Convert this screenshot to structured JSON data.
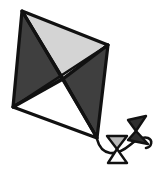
{
  "artwork": {
    "title": "Kite",
    "subject": "diamond kite with trailing tail and two bow ties",
    "caption": "kite",
    "background_color": "#ffffff",
    "outline_color": "#111111"
  },
  "palette": {
    "light_gray": "#d4d4d4",
    "dark_gray": "#3f3f3f",
    "white": "#ffffff",
    "outline": "#111111",
    "mid_gray": "#b8b8b8"
  },
  "kite": {
    "name": "diamond-kite",
    "vertices": {
      "top": {
        "x": 22,
        "y": 11
      },
      "right": {
        "x": 108,
        "y": 45
      },
      "bottom": {
        "x": 97,
        "y": 138
      },
      "left": {
        "x": 13,
        "y": 107
      },
      "center": {
        "x": 63,
        "y": 79
      }
    },
    "panels": [
      {
        "name": "top-panel",
        "fill": "#d4d4d4",
        "points": "22,11 108,45 63,79"
      },
      {
        "name": "left-panel",
        "fill": "#3f3f3f",
        "points": "22,11 63,79 13,107"
      },
      {
        "name": "right-panel",
        "fill": "#3f3f3f",
        "points": "108,45 97,138 63,79"
      },
      {
        "name": "bottom-panel",
        "fill": "#ffffff",
        "points": "13,107 63,79 97,138"
      }
    ],
    "spars": [
      {
        "name": "spar-vertical",
        "d": "M22,11 L97,138"
      },
      {
        "name": "spar-horizontal",
        "d": "M13,107 L108,45"
      }
    ]
  },
  "tail": {
    "name": "kite-tail",
    "string_path": "M97,139 C99,147 104,152 110,153 C118,154 124,150 130,145 C136,140 142,136 148,138 C153,140 152,147 146,148",
    "bows": [
      {
        "name": "bow-tie-lower",
        "orientation": "vertical",
        "upper_triangle": {
          "fill": "#b8b8b8",
          "points": "107,136 127,136 117,149"
        },
        "lower_triangle": {
          "fill": "#ffffff",
          "points": "117,149 108,163 127,163"
        }
      },
      {
        "name": "bow-tie-upper",
        "orientation": "rotated",
        "upper_triangle": {
          "fill": "#2e2e2e",
          "points": "128,120 146,116 136,131"
        },
        "lower_triangle": {
          "fill": "#2e2e2e",
          "points": "136,131 148,144 128,140"
        }
      }
    ]
  }
}
